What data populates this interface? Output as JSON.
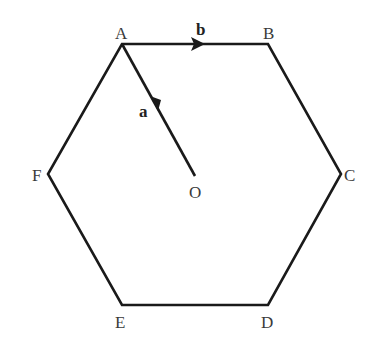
{
  "diagram": {
    "type": "regular-hexagon",
    "stroke_color": "#1a1a1a",
    "vertices": [
      {
        "name": "A",
        "label": "A"
      },
      {
        "name": "B",
        "label": "B"
      },
      {
        "name": "C",
        "label": "C"
      },
      {
        "name": "D",
        "label": "D"
      },
      {
        "name": "E",
        "label": "E"
      },
      {
        "name": "F",
        "label": "F"
      }
    ],
    "center": {
      "name": "O",
      "label": "O"
    },
    "vectors": [
      {
        "name": "a",
        "label": "a",
        "from": "O",
        "to": "A"
      },
      {
        "name": "b",
        "label": "b",
        "from": "A",
        "to": "B"
      }
    ]
  }
}
